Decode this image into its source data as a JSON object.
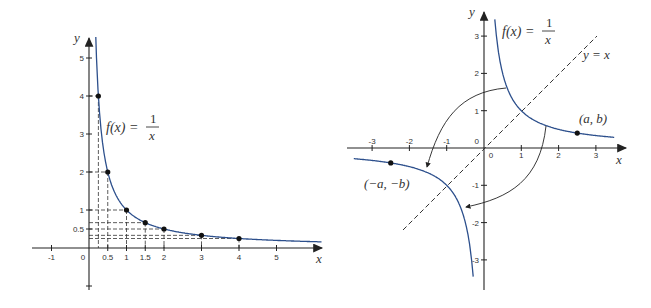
{
  "left_graph": {
    "title": "f(x) = 1/x (first quadrant with sample points)",
    "formula": {
      "lhs": "f(x) =",
      "num": "1",
      "den": "x"
    },
    "axis_labels": {
      "x": "x",
      "y": "y"
    },
    "x_ticks": [
      {
        "v": -1,
        "label": "-1"
      },
      {
        "v": 0,
        "label": "0"
      },
      {
        "v": 0.5,
        "label": "0.5"
      },
      {
        "v": 1,
        "label": "1"
      },
      {
        "v": 1.5,
        "label": "1.5"
      },
      {
        "v": 2,
        "label": "2"
      },
      {
        "v": 3,
        "label": "3"
      },
      {
        "v": 4,
        "label": "4"
      },
      {
        "v": 5,
        "label": "5"
      }
    ],
    "y_ticks": [
      {
        "v": 0.5,
        "label": "0.5"
      },
      {
        "v": 1,
        "label": "1"
      },
      {
        "v": 2,
        "label": "2"
      },
      {
        "v": 3,
        "label": "3"
      },
      {
        "v": 4,
        "label": "4"
      },
      {
        "v": 5,
        "label": "5"
      },
      {
        "v": -1,
        "label": ""
      }
    ],
    "points": [
      {
        "x": 0.25,
        "y": 4
      },
      {
        "x": 0.5,
        "y": 2
      },
      {
        "x": 1,
        "y": 1
      },
      {
        "x": 1.5,
        "y": 0.667
      },
      {
        "x": 2,
        "y": 0.5
      },
      {
        "x": 3,
        "y": 0.333
      },
      {
        "x": 4,
        "y": 0.25
      }
    ]
  },
  "right_graph": {
    "title": "f(x) = 1/x symmetric about origin and y = x",
    "formula": {
      "lhs": "f(x) =",
      "num": "1",
      "den": "x"
    },
    "line_label": "y = x",
    "point_label": "(a, b)",
    "reflected_point_label": "(−a, −b)",
    "axis_labels": {
      "x": "x",
      "y": "y"
    },
    "x_ticks": [
      {
        "v": -3,
        "label": "-3"
      },
      {
        "v": -2,
        "label": "-2"
      },
      {
        "v": -1,
        "label": "-1"
      },
      {
        "v": 0,
        "label": "0"
      },
      {
        "v": 1,
        "label": "1"
      },
      {
        "v": 2,
        "label": "2"
      },
      {
        "v": 3,
        "label": "3"
      }
    ],
    "y_ticks": [
      {
        "v": 3,
        "label": "3"
      },
      {
        "v": 2,
        "label": "2"
      },
      {
        "v": 1,
        "label": "1"
      },
      {
        "v": 0,
        "label": "0"
      },
      {
        "v": -1,
        "label": "-1"
      },
      {
        "v": -2,
        "label": "-2"
      },
      {
        "v": -3,
        "label": "-3"
      }
    ],
    "points": [
      {
        "x": 2.5,
        "y": 0.4
      },
      {
        "x": -2.5,
        "y": -0.4
      }
    ]
  },
  "colors": {
    "curve": "#2c4f8c",
    "axis": "#222222",
    "dash": "#333333",
    "point": "#111111"
  }
}
